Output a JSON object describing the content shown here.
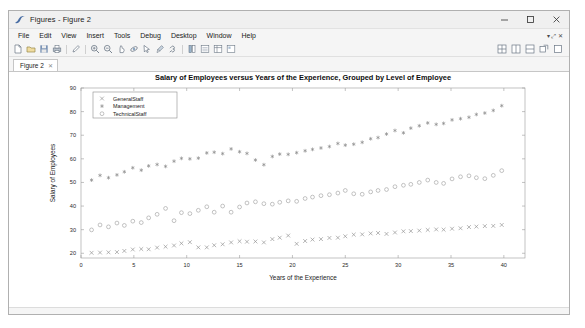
{
  "window": {
    "title": "Figures - Figure 2",
    "app_icon": "matlab-figure-icon",
    "minimize_label": "─",
    "maximize_label": "□",
    "close_label": "✕"
  },
  "menubar": {
    "items": [
      {
        "label": "File"
      },
      {
        "label": "Edit"
      },
      {
        "label": "View"
      },
      {
        "label": "Insert"
      },
      {
        "label": "Tools"
      },
      {
        "label": "Debug"
      },
      {
        "label": "Desktop"
      },
      {
        "label": "Window"
      },
      {
        "label": "Help"
      }
    ],
    "right_glyphs": "▾ ⤢ ✕"
  },
  "toolbar": {
    "items": [
      {
        "name": "new-figure-icon"
      },
      {
        "name": "open-file-icon"
      },
      {
        "name": "save-figure-icon"
      },
      {
        "name": "print-figure-icon"
      },
      {
        "name": "edit-plot-icon"
      },
      {
        "name": "zoom-in-icon"
      },
      {
        "name": "zoom-out-icon"
      },
      {
        "name": "pan-icon"
      },
      {
        "name": "rotate-3d-icon"
      },
      {
        "name": "data-cursor-icon"
      },
      {
        "name": "brush-icon"
      },
      {
        "name": "link-plot-icon"
      },
      {
        "name": "colorbar-icon"
      },
      {
        "name": "legend-icon"
      },
      {
        "name": "plot-browser-icon"
      },
      {
        "name": "figure-palette-icon"
      }
    ],
    "right_items": [
      {
        "name": "tile-layout-icon"
      },
      {
        "name": "two-pane-layout-icon"
      },
      {
        "name": "stack-layout-icon"
      },
      {
        "name": "undock-icon"
      },
      {
        "name": "dock-icon"
      }
    ]
  },
  "tabs": [
    {
      "label": "Figure 2",
      "close": "✕",
      "active": true
    }
  ],
  "chart_data": {
    "type": "scatter",
    "title": "Salary of Employees versus Years of the Experience, Grouped by Level of Employee",
    "xlabel": "Years of the Experience",
    "ylabel": "Salary of Employees",
    "xlim": [
      0,
      42
    ],
    "ylim": [
      18,
      90
    ],
    "xticks": [
      0,
      5,
      10,
      15,
      20,
      25,
      30,
      35,
      40
    ],
    "yticks": [
      20,
      30,
      40,
      50,
      60,
      70,
      80,
      90
    ],
    "grid": false,
    "legend_position": "upper-left",
    "series": [
      {
        "name": "GeneralStaff",
        "marker": "x",
        "color": "#8c8c8c",
        "x": [
          1,
          1.8,
          2.6,
          3.4,
          4.1,
          4.9,
          5.7,
          6.4,
          7.2,
          8.0,
          8.8,
          9.5,
          10.3,
          11.1,
          11.9,
          12.6,
          13.4,
          14.2,
          15.0,
          15.7,
          16.5,
          17.3,
          18.1,
          18.8,
          19.6,
          20.4,
          21.2,
          21.9,
          22.7,
          23.5,
          24.3,
          25.0,
          25.8,
          26.6,
          27.4,
          28.1,
          28.9,
          29.7,
          30.5,
          31.2,
          32.0,
          32.8,
          33.6,
          34.3,
          35.1,
          35.9,
          36.7,
          37.4,
          38.2,
          39.0,
          39.8
        ],
        "y": [
          20.2,
          20.3,
          20.4,
          20.5,
          21.0,
          21.6,
          21.8,
          21.7,
          22.4,
          22.8,
          23.3,
          24.2,
          24.7,
          22.5,
          22.5,
          23.4,
          23.8,
          24.6,
          25.1,
          24.9,
          25.0,
          24.6,
          26.0,
          26.6,
          27.5,
          24.0,
          25.2,
          25.8,
          26.0,
          26.5,
          26.6,
          27.2,
          27.9,
          28.0,
          28.4,
          28.6,
          28.2,
          28.8,
          29.3,
          29.4,
          29.6,
          29.9,
          30.1,
          30.0,
          30.4,
          30.6,
          31.1,
          31.3,
          31.5,
          31.6,
          32.0
        ]
      },
      {
        "name": "Management",
        "marker": "*",
        "color": "#8a8a8a",
        "x": [
          1,
          1.8,
          2.6,
          3.4,
          4.1,
          4.9,
          5.7,
          6.4,
          7.2,
          8.0,
          8.8,
          9.5,
          10.3,
          11.1,
          11.9,
          12.6,
          13.4,
          14.2,
          15.0,
          15.7,
          16.5,
          17.3,
          18.1,
          18.8,
          19.6,
          20.4,
          21.2,
          21.9,
          22.7,
          23.5,
          24.3,
          25.0,
          25.8,
          26.6,
          27.4,
          28.1,
          28.9,
          29.7,
          30.5,
          31.2,
          32.0,
          32.8,
          33.6,
          34.3,
          35.1,
          35.9,
          36.7,
          37.4,
          38.2,
          39.0,
          39.8
        ],
        "y": [
          51.0,
          53.0,
          52.0,
          53.2,
          54.5,
          56.2,
          55.2,
          57.0,
          57.6,
          56.8,
          59.0,
          60.2,
          60.0,
          60.3,
          62.5,
          62.8,
          62.2,
          64.2,
          63.0,
          62.3,
          59.5,
          57.5,
          61.0,
          62.0,
          61.9,
          62.6,
          63.4,
          64.0,
          64.6,
          65.2,
          66.5,
          65.8,
          66.2,
          67.0,
          68.5,
          69.0,
          70.5,
          72.0,
          71.0,
          73.0,
          74.0,
          75.2,
          74.6,
          75.0,
          76.5,
          77.0,
          77.6,
          78.8,
          79.4,
          80.5,
          82.5
        ]
      },
      {
        "name": "TechnicalStaff",
        "marker": "o",
        "color": "#9a9a9a",
        "x": [
          1,
          1.8,
          2.6,
          3.4,
          4.1,
          4.9,
          5.7,
          6.4,
          7.2,
          8.0,
          8.8,
          9.5,
          10.3,
          11.1,
          11.9,
          12.6,
          13.4,
          14.2,
          15.0,
          15.7,
          16.5,
          17.3,
          18.1,
          18.8,
          19.6,
          20.4,
          21.2,
          21.9,
          22.7,
          23.5,
          24.3,
          25.0,
          25.8,
          26.6,
          27.4,
          28.1,
          28.9,
          29.7,
          30.5,
          31.2,
          32.0,
          32.8,
          33.6,
          34.3,
          35.1,
          35.9,
          36.7,
          37.4,
          38.2,
          39.0,
          39.8
        ],
        "y": [
          29.9,
          32.0,
          31.2,
          32.8,
          31.8,
          33.6,
          33.0,
          35.0,
          36.5,
          39.0,
          33.8,
          37.2,
          36.8,
          38.2,
          39.7,
          37.4,
          40.0,
          37.4,
          39.6,
          41.3,
          41.8,
          41.0,
          40.8,
          41.6,
          42.2,
          42.0,
          43.2,
          43.8,
          44.4,
          44.8,
          45.5,
          46.6,
          45.2,
          45.0,
          46.0,
          46.6,
          47.0,
          48.2,
          48.8,
          49.2,
          50.0,
          51.0,
          50.0,
          49.6,
          51.5,
          52.4,
          52.8,
          52.0,
          51.6,
          53.0,
          55.0
        ]
      }
    ]
  }
}
